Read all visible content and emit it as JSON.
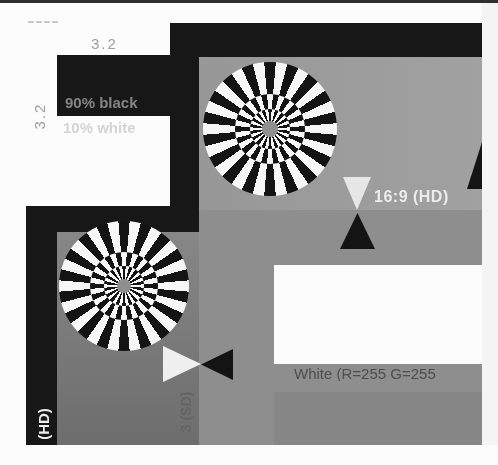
{
  "labels": {
    "wedge_value_top": "3.2",
    "wedge_value_left": "3.2",
    "black_patch": "90% black",
    "white_patch": "10% white",
    "hd_safe_area": "16:9 (HD)",
    "hd_safe_area_vertical": "(HD)",
    "sd_safe_area_vertical": "3 (SD)",
    "white_reference": "White (R=255 G=255"
  },
  "markers": {
    "vertical_pair": [
      "triangle-down-white",
      "triangle-up-black"
    ],
    "horizontal_pair": [
      "triangle-right-white",
      "triangle-left-black"
    ],
    "right_edge": "triangle-up-black-partial"
  },
  "pattern": {
    "siemens_star_count": 2,
    "siemens_star_segments": 18,
    "phase_reversal_diameters_pct": [
      52,
      30
    ],
    "center_dot_diameter_pct": 14
  },
  "colors": {
    "chart-black": "#171717",
    "field-hd": "#9c9c9c",
    "field-sd": "#8e8e8e",
    "field-sd-dark": "#7e7e7e",
    "paper-white": "#fcfcfc",
    "star-black": "#141414",
    "star-white": "#f7f7f7",
    "center-dot": "#8f8f8f",
    "label-on-black": "#858585",
    "label-faint": "#d4d4d4",
    "label-mid": "#a0a0a0",
    "label-dark": "#4e4e4e",
    "label-white": "#ececec",
    "sd-label": "#646464",
    "photo-margin": "#f4f4f4",
    "top-edge": "#2f2f2f",
    "band-bottom": "#868686"
  }
}
